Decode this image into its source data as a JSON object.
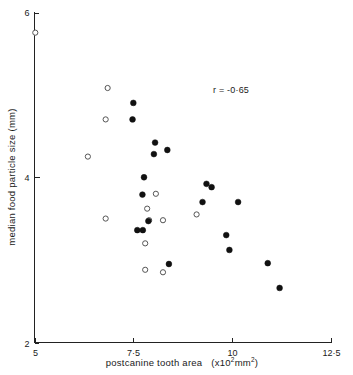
{
  "chart_data": {
    "type": "scatter",
    "title": "",
    "xlabel": "postcanine tooth area (x10²mm²)",
    "ylabel": "median food particle size (mm)",
    "xlim": [
      5,
      12.5
    ],
    "ylim": [
      2,
      6
    ],
    "xticks": [
      5,
      7.5,
      10,
      12.5
    ],
    "xtick_labels": [
      "5",
      "7·5",
      "10",
      "12·5"
    ],
    "yticks": [
      2,
      4,
      6
    ],
    "ytick_labels": [
      "2",
      "4",
      "6"
    ],
    "grid": false,
    "legend_position": "none",
    "annotations": [
      {
        "text": "r = -0·65",
        "x": 9.4,
        "y": 4.95
      }
    ],
    "series": [
      {
        "name": "filled-circles",
        "marker": "filled-circle",
        "color": "#111111",
        "points": [
          {
            "x": 7.5,
            "y": 4.9
          },
          {
            "x": 7.48,
            "y": 4.7
          },
          {
            "x": 8.05,
            "y": 4.42
          },
          {
            "x": 8.02,
            "y": 4.28
          },
          {
            "x": 8.36,
            "y": 4.33
          },
          {
            "x": 7.77,
            "y": 4.0
          },
          {
            "x": 7.73,
            "y": 3.79
          },
          {
            "x": 9.35,
            "y": 3.92
          },
          {
            "x": 9.48,
            "y": 3.88
          },
          {
            "x": 9.25,
            "y": 3.7
          },
          {
            "x": 10.15,
            "y": 3.7
          },
          {
            "x": 7.88,
            "y": 3.47
          },
          {
            "x": 7.6,
            "y": 3.36
          },
          {
            "x": 7.74,
            "y": 3.36
          },
          {
            "x": 9.85,
            "y": 3.3
          },
          {
            "x": 9.93,
            "y": 3.12
          },
          {
            "x": 8.4,
            "y": 2.95
          },
          {
            "x": 10.9,
            "y": 2.96
          },
          {
            "x": 11.2,
            "y": 2.66
          }
        ]
      },
      {
        "name": "open-circles",
        "marker": "open-circle",
        "color": "#555555",
        "points": [
          {
            "x": 5.02,
            "y": 5.75
          },
          {
            "x": 6.85,
            "y": 5.08
          },
          {
            "x": 6.8,
            "y": 4.7
          },
          {
            "x": 6.35,
            "y": 4.25
          },
          {
            "x": 8.07,
            "y": 3.8
          },
          {
            "x": 7.85,
            "y": 3.62
          },
          {
            "x": 9.1,
            "y": 3.55
          },
          {
            "x": 6.8,
            "y": 3.5
          },
          {
            "x": 7.9,
            "y": 3.48
          },
          {
            "x": 8.25,
            "y": 3.48
          },
          {
            "x": 7.8,
            "y": 3.2
          },
          {
            "x": 7.8,
            "y": 2.88
          },
          {
            "x": 8.25,
            "y": 2.85
          }
        ]
      }
    ]
  },
  "axes": {
    "x_title": "postcanine tooth area",
    "x_units_prefix": "(x10",
    "x_units_exp": "2",
    "x_units_suffix": "mm",
    "x_units_exp2": "2",
    "x_units_close": ")",
    "y_title": "median food particle size (mm)"
  }
}
